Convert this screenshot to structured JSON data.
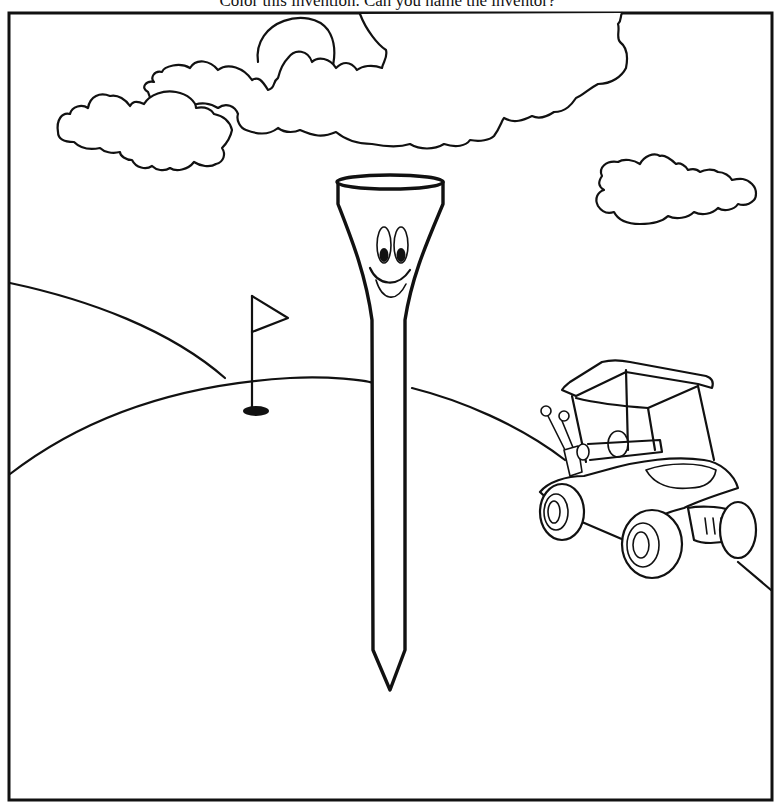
{
  "page": {
    "caption": "Color this invention. Can you name the inventor?"
  },
  "illustration": {
    "subject": "golf-tee",
    "elements": [
      "frame",
      "sun",
      "large-cloud",
      "left-cloud",
      "small-cloud-right",
      "back-hill",
      "front-hill",
      "right-hill-slope",
      "flag-pin",
      "hole",
      "golf-tee-character",
      "golf-cart"
    ],
    "colors": {
      "line": "#111111",
      "background": "#ffffff"
    }
  }
}
